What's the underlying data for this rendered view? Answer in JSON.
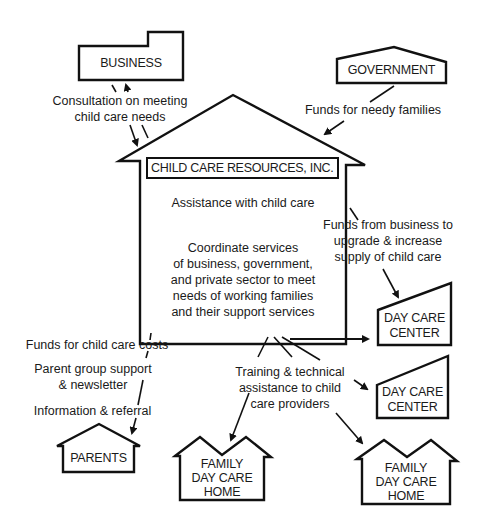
{
  "center": {
    "title": "CHILD CARE RESOURCES, INC.",
    "assistance": "Assistance with child care",
    "coordinate_lines": [
      "Coordinate services",
      "of business, government,",
      "and private sector to meet",
      "needs of working families",
      "and their support services"
    ]
  },
  "nodes": {
    "business": "BUSINESS",
    "government": "GOVERNMENT",
    "day_care_center_1": [
      "DAY CARE",
      "CENTER"
    ],
    "day_care_center_2": [
      "DAY CARE",
      "CENTER"
    ],
    "parents": "PARENTS",
    "family_home_1": [
      "FAMILY",
      "DAY CARE",
      "HOME"
    ],
    "family_home_2": [
      "FAMILY",
      "DAY CARE",
      "HOME"
    ]
  },
  "edges": {
    "business_consultation": [
      "Consultation on meeting",
      "child care needs"
    ],
    "government_funds": "Funds  for needy families",
    "business_funds": [
      "Funds from business to",
      "upgrade & increase",
      "supply of child care"
    ],
    "parents_funds": "Funds for child care costs",
    "parents_support": [
      "Parent group support",
      "& newsletter"
    ],
    "parents_info": "Information & referral",
    "training": [
      "Training & technical",
      "assistance to child",
      "care providers"
    ]
  }
}
